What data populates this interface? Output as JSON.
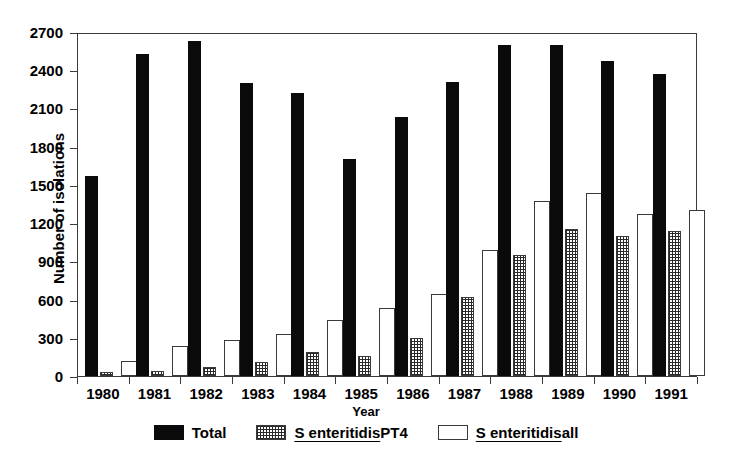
{
  "chart_data": {
    "type": "bar",
    "title": "",
    "xlabel": "Year",
    "ylabel": "Number of isolations",
    "categories": [
      "1980",
      "1981",
      "1982",
      "1983",
      "1984",
      "1985",
      "1986",
      "1987",
      "1988",
      "1989",
      "1990",
      "1991"
    ],
    "ylim": [
      0,
      2700
    ],
    "ytick_values": [
      0,
      300,
      600,
      900,
      1200,
      1500,
      1800,
      2100,
      2400,
      2700
    ],
    "ytick_labels": [
      "0",
      "300",
      "600",
      "900",
      "1200",
      "1500",
      "1800",
      "2100",
      "2400",
      "2700"
    ],
    "grid": false,
    "legend_position": "below",
    "series": [
      {
        "name": "Total",
        "style": "solid-black",
        "color": "#0a0a0a",
        "values": [
          1570,
          2530,
          2630,
          2300,
          2220,
          1700,
          2030,
          2310,
          2600,
          2600,
          2470,
          2370
        ]
      },
      {
        "name": "S enteritidis PT4",
        "style": "cross-hatch",
        "color": "#2a2a2a",
        "values": [
          30,
          40,
          70,
          110,
          190,
          155,
          300,
          620,
          950,
          1150,
          1100,
          1140
        ]
      },
      {
        "name": "S enteritidis all",
        "style": "white-outline",
        "color": "#ffffff",
        "values": [
          120,
          235,
          280,
          330,
          440,
          530,
          640,
          990,
          1370,
          1440,
          1270,
          1300
        ]
      }
    ]
  },
  "legend": {
    "items": [
      {
        "label": "Total",
        "label_prefix": "",
        "label_suffix": "",
        "swatch": "solid-black-swatch"
      },
      {
        "label": "S enteritidis PT4",
        "label_prefix": "S enteritidis",
        "label_suffix": "PT4",
        "swatch": "cross-hatch-swatch"
      },
      {
        "label": "S enteritidis all",
        "label_prefix": "S enteritidis",
        "label_suffix": "all",
        "swatch": "white-outline-swatch"
      }
    ]
  },
  "axes": {
    "y_title": "Number of isolations",
    "x_title": "Year"
  }
}
